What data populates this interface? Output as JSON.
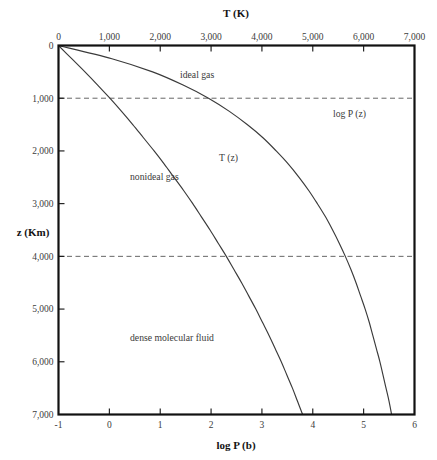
{
  "figure": {
    "background": "#ffffff",
    "line_color": "#3a3a3a",
    "axis_color": "#111111",
    "grid_color": "#555555"
  },
  "axes": {
    "top": {
      "title": "T (K)",
      "name": "temperature-axis",
      "min": 0,
      "max": 7000,
      "ticks": [
        0,
        1000,
        2000,
        3000,
        4000,
        5000,
        6000,
        7000
      ],
      "tick_labels": [
        "0",
        "1,000",
        "2,000",
        "3,000",
        "4,000",
        "5,000",
        "6,000",
        "7,000"
      ]
    },
    "bottom": {
      "title": "log P (b)",
      "name": "pressure-axis",
      "min": -1,
      "max": 6,
      "ticks": [
        -1,
        0,
        1,
        2,
        3,
        4,
        5,
        6
      ],
      "tick_labels": [
        "-1",
        "0",
        "1",
        "2",
        "3",
        "4",
        "5",
        "6"
      ]
    },
    "left": {
      "title": "z (Km)",
      "name": "depth-axis",
      "min": 0,
      "max": 7000,
      "inverted": true,
      "ticks": [
        0,
        1000,
        2000,
        3000,
        4000,
        5000,
        6000,
        7000
      ],
      "tick_labels": [
        "0",
        "1,000",
        "2,000",
        "3,000",
        "4,000",
        "5,000",
        "6,000",
        "7,000"
      ]
    }
  },
  "gridlines": {
    "values": [
      1000,
      4000
    ],
    "style": "dashed"
  },
  "annotations": [
    {
      "id": "ideal-gas",
      "text": "ideal gas",
      "x": 180,
      "y": 78
    },
    {
      "id": "nonideal-gas",
      "text": "nonideal gas",
      "x": 130,
      "y": 180
    },
    {
      "id": "dense-molecular-fluid",
      "text": "dense molecular fluid",
      "x": 130,
      "y": 341
    },
    {
      "id": "log-p-curve-label",
      "text": "log P (z)",
      "x": 333,
      "y": 117
    },
    {
      "id": "t-curve-label",
      "text": "T (z)",
      "x": 219,
      "y": 161
    }
  ],
  "chart_data": {
    "type": "line",
    "title": "",
    "subtitle": "",
    "xlabel": "log P (b)",
    "ylabel": "z (Km)",
    "x2label": "T (K)",
    "xlim": [
      -1,
      6
    ],
    "x2lim": [
      0,
      7000
    ],
    "ylim": [
      7000,
      0
    ],
    "y_inverted": true,
    "grid": true,
    "grid_axis": "y",
    "grid_values": [
      1000,
      4000
    ],
    "legend": "none",
    "legend_position": "inline-annotation",
    "series": [
      {
        "name": "T (z)",
        "label": "T (z)",
        "axis": "top",
        "units": "K",
        "description": "Temperature versus depth; read against the top T (K) axis.",
        "z_km": [
          0,
          250,
          500,
          750,
          1000,
          1250,
          1500,
          1750,
          2000,
          2250,
          2500,
          2750,
          3000,
          3250,
          3500,
          3750,
          4000,
          4250,
          4500,
          4750,
          5000,
          5250,
          5500,
          5750,
          6000,
          6250,
          6500,
          6750,
          7000
        ],
        "T_K": [
          0,
          260,
          520,
          770,
          1010,
          1240,
          1460,
          1670,
          1880,
          2080,
          2270,
          2460,
          2640,
          2810,
          2980,
          3140,
          3300,
          3450,
          3600,
          3740,
          3880,
          4010,
          4140,
          4260,
          4380,
          4490,
          4600,
          4700,
          4800
        ]
      },
      {
        "name": "log P (z)",
        "label": "log P (z)",
        "axis": "bottom",
        "units": "log10(bar)",
        "description": "Base-10 logarithm of pressure versus depth; read against the bottom log P (b) axis.",
        "z_km": [
          0,
          250,
          500,
          750,
          1000,
          1250,
          1500,
          1750,
          2000,
          2250,
          2500,
          2750,
          3000,
          3250,
          3500,
          3750,
          4000,
          4250,
          4500,
          4750,
          5000,
          5250,
          5500,
          5750,
          6000,
          6250,
          6500,
          6750,
          7000
        ],
        "logP_b": [
          -1.0,
          0.05,
          0.85,
          1.45,
          1.95,
          2.36,
          2.71,
          3.02,
          3.28,
          3.52,
          3.73,
          3.92,
          4.09,
          4.25,
          4.39,
          4.52,
          4.64,
          4.75,
          4.85,
          4.94,
          5.03,
          5.11,
          5.18,
          5.25,
          5.32,
          5.38,
          5.44,
          5.5,
          5.55
        ]
      }
    ],
    "regions": [
      {
        "label": "ideal gas",
        "note": "uppermost, low pressure region"
      },
      {
        "label": "nonideal gas",
        "note": "intermediate region"
      },
      {
        "label": "dense molecular fluid",
        "note": "deepest, high pressure region"
      }
    ]
  }
}
